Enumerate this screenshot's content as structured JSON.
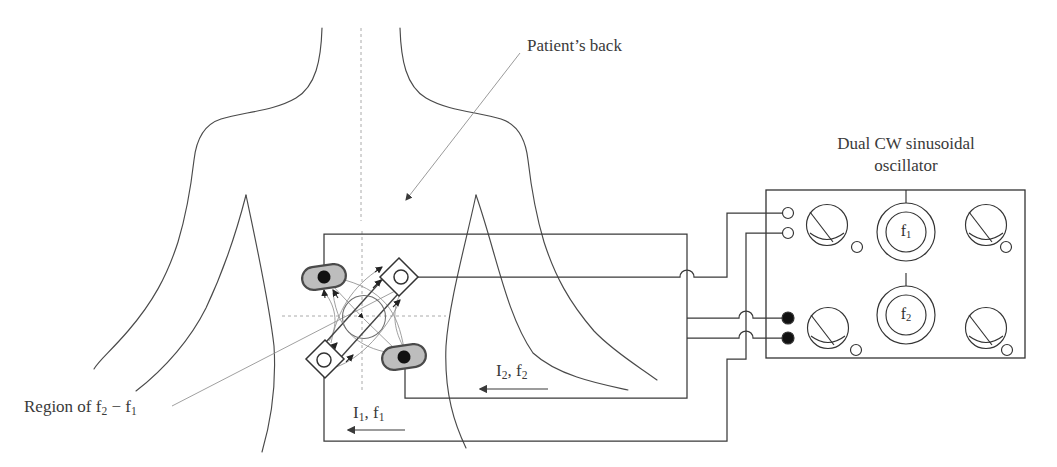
{
  "labels": {
    "patients_back": "Patient’s back",
    "oscillator": {
      "line1": "Dual CW sinusoidal",
      "line2": "oscillator"
    },
    "region": {
      "pre": "Region of f",
      "sub1": "2",
      "mid": " − f",
      "sub2": "1"
    },
    "i2f2": {
      "base": "I",
      "sub1": "2",
      "mid": ", f",
      "sub2": "2"
    },
    "i1f1": {
      "base": "I",
      "sub1": "1",
      "mid": ", f",
      "sub2": "1"
    },
    "dial_f1": {
      "base": "f",
      "sub": "1"
    },
    "dial_f2": {
      "base": "f",
      "sub": "2"
    }
  },
  "colors": {
    "ink": "#3a3a3a",
    "body_line": "#4a4a4a",
    "wire": "#3a3a3a",
    "thin_line": "#8f8f8f",
    "dashed": "#aaaaaa",
    "electrode_fill": "#bdbdbd",
    "electrode_dot": "#111111",
    "diagram_bg": "#ffffff"
  },
  "diagram": {
    "electrodes": [
      {
        "position": "top-left",
        "shape": "stadium",
        "contact": "filled-dot"
      },
      {
        "position": "top-right",
        "shape": "diamond",
        "contact": "open-circle"
      },
      {
        "position": "bottom-left",
        "shape": "diamond",
        "contact": "open-circle"
      },
      {
        "position": "bottom-right",
        "shape": "stadium",
        "contact": "filled-dot"
      }
    ],
    "oscillator_panel": {
      "open_terminals": 2,
      "filled_terminals": 2,
      "meters": 4,
      "frequency_dials": 2,
      "indicator_lights": 4
    }
  }
}
